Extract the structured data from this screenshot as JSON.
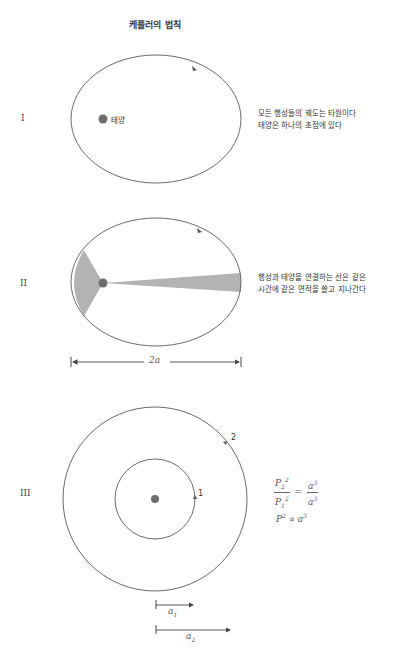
{
  "title": "케플러의 법칙",
  "laws": [
    {
      "numeral": "I",
      "sun_label": "태양",
      "description": [
        "모든 행성들의 궤도는 타원이다",
        "태양은 하나의 초점에 있다"
      ]
    },
    {
      "numeral": "II",
      "description": [
        "행성과 태양을 연결하는 선은 같은",
        "시간에 같은 면적을 쓸고 지나간다"
      ],
      "axis_label": "2a"
    },
    {
      "numeral": "III",
      "planet_labels": [
        "1",
        "2"
      ],
      "formula_ratio": {
        "P2": "P",
        "P2_sub": "2",
        "P_sup": "2",
        "P1": "P",
        "P1_sub": "1",
        "a2": "a",
        "a_sup": "3",
        "a1": "a",
        "eq": "="
      },
      "formula_prop": {
        "left": "P",
        "left_sup": "2",
        "op": "∝",
        "right": "a",
        "right_sup": "3"
      },
      "axis_labels": [
        {
          "base": "a",
          "sub": "1"
        },
        {
          "base": "a",
          "sub": "2"
        }
      ]
    }
  ],
  "colors": {
    "orbit": "#6b6b6b",
    "sun": "#6e6e6e",
    "swept_area": "#b3b3b3"
  }
}
